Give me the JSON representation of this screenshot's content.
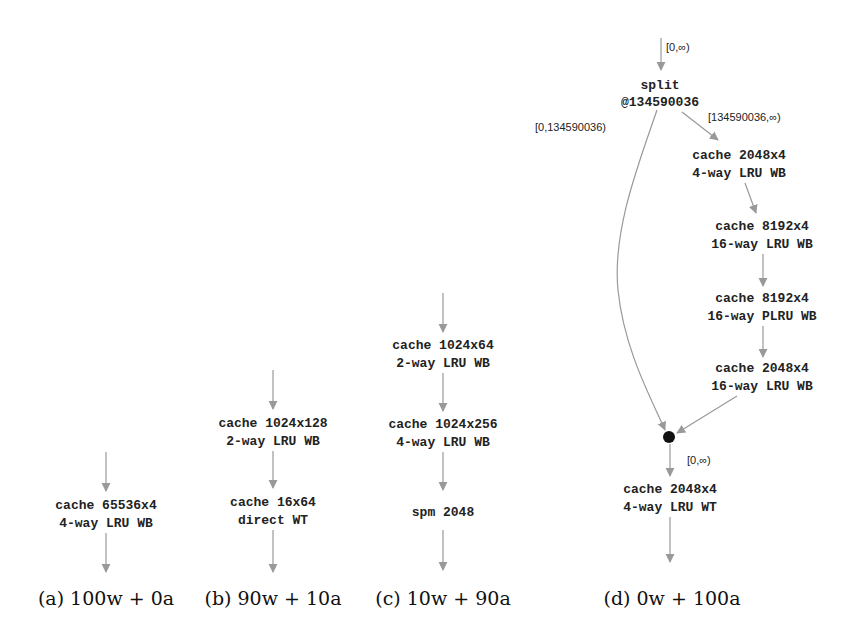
{
  "figure": {
    "panels": [
      {
        "id": "a",
        "caption": "(a) 100w + 0a",
        "nodes": [
          {
            "line1": "cache 65536x4",
            "line2": "4-way LRU WB"
          }
        ]
      },
      {
        "id": "b",
        "caption": "(b) 90w + 10a",
        "nodes": [
          {
            "line1": "cache 1024x128",
            "line2": "2-way LRU WB"
          },
          {
            "line1": "cache 16x64",
            "line2": "direct WT"
          }
        ]
      },
      {
        "id": "c",
        "caption": "(c) 10w + 90a",
        "nodes": [
          {
            "line1": "cache 1024x64",
            "line2": "2-way LRU WB"
          },
          {
            "line1": "cache 1024x256",
            "line2": "4-way LRU WB"
          },
          {
            "line1": "spm 2048",
            "line2": ""
          }
        ]
      },
      {
        "id": "d",
        "caption": "(d) 0w + 100a",
        "split": {
          "line1": "split",
          "line2": "@134590036"
        },
        "edge_labels": {
          "input": "[0,∞)",
          "left_branch": "[0,134590036)",
          "right_branch": "[134590036,∞)",
          "after_join": "[0,∞)"
        },
        "nodes": [
          {
            "line1": "cache 2048x4",
            "line2": "4-way LRU WB"
          },
          {
            "line1": "cache 8192x4",
            "line2": "16-way LRU WB"
          },
          {
            "line1": "cache 8192x4",
            "line2": "16-way PLRU WB"
          },
          {
            "line1": "cache 2048x4",
            "line2": "16-way LRU WB"
          },
          {
            "line1": "cache 2048x4",
            "line2": "4-way LRU WT"
          }
        ]
      }
    ],
    "colors": {
      "edge": "#999999",
      "text": "#222222",
      "join_dot": "#111111"
    }
  }
}
